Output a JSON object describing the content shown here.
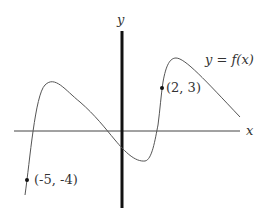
{
  "axes": {
    "x_label": "x",
    "y_label": "y"
  },
  "curve": {
    "label": "y = f(x)",
    "color": "#555555"
  },
  "points": [
    {
      "label": "(-5, -4)",
      "x": -5,
      "y": -4
    },
    {
      "label": "(2, 3)",
      "x": 2,
      "y": 3
    }
  ]
}
